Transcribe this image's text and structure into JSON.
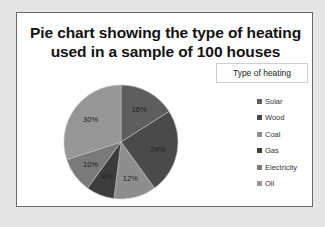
{
  "chart_data": {
    "type": "pie",
    "title": "Pie chart showing the type of heating used in a sample of 100 houses",
    "title_lines": [
      "Pie chart showing the type of heating",
      "used in a sample of 100 houses"
    ],
    "legend_title": "Type of heating",
    "legend_position": "right",
    "start_angle": "12 o'clock, clockwise",
    "categories": [
      "Solar",
      "Wood",
      "Coal",
      "Gas",
      "Electricity",
      "Oil"
    ],
    "values": [
      16,
      24,
      12,
      8,
      10,
      30
    ],
    "labels": [
      "16%",
      "24%",
      "12%",
      "8%",
      "10%",
      "30%"
    ],
    "colors": [
      "#5e5e5e",
      "#4a4a4a",
      "#8e8e8e",
      "#3c3c3c",
      "#7a7a7a",
      "#969696"
    ]
  }
}
